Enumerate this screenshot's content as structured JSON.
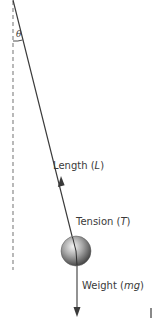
{
  "diagram": {
    "angle_label": "θ",
    "labels": {
      "length": {
        "text": "Length (",
        "var": "L",
        "close": ")"
      },
      "tension": {
        "text": "Tension (",
        "var": "T",
        "close": ")"
      },
      "weight": {
        "text": "Weight (",
        "var": "mg",
        "close": ")"
      }
    },
    "colors": {
      "string": "#3a3a3a",
      "dashed_vertical": "#8a8a8a",
      "arrow": "#4a4a4a",
      "bob_light": "#f2f2f2",
      "bob_mid": "#9a9a9a",
      "bob_dark": "#3c3c3c",
      "text": "#3a3a3a"
    }
  }
}
